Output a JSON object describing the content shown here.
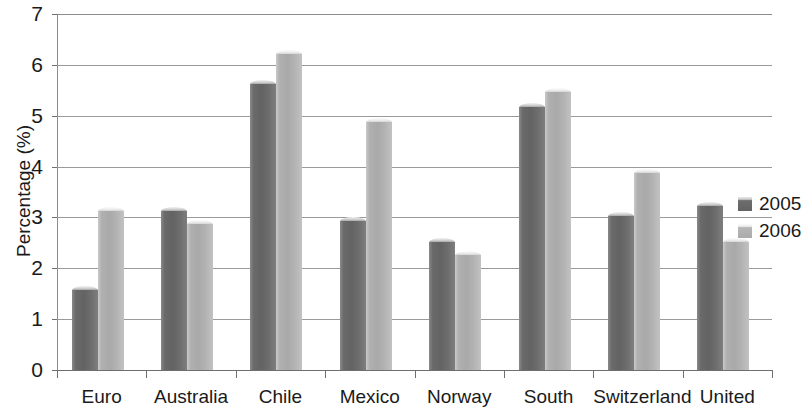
{
  "chart_data": {
    "type": "bar",
    "title": "",
    "xlabel": "",
    "ylabel": "Percentage (%)",
    "ylim": [
      0,
      7
    ],
    "ytick_labels": [
      "7",
      "6",
      "5",
      "4",
      "3",
      "2",
      "1",
      "0"
    ],
    "ytick_values": [
      7,
      6,
      5,
      4,
      3,
      2,
      1,
      0
    ],
    "grid": true,
    "legend_position": "right",
    "categories": [
      "Euro",
      "Australia",
      "Chile",
      "Mexico",
      "Norway",
      "South",
      "Switzerland",
      "United"
    ],
    "series": [
      {
        "name": "2005",
        "color": "#6a6a6a",
        "values": [
          1.65,
          3.2,
          5.7,
          3.0,
          2.6,
          5.25,
          3.1,
          3.3
        ]
      },
      {
        "name": "2006",
        "color": "#b0b0b0",
        "values": [
          3.2,
          2.95,
          6.3,
          4.95,
          2.35,
          5.55,
          3.95,
          2.6
        ]
      }
    ]
  },
  "legend": {
    "items": [
      {
        "label": "2005",
        "swatch": "legend-swatch-2005"
      },
      {
        "label": "2006",
        "swatch": "legend-swatch-2006"
      }
    ]
  }
}
